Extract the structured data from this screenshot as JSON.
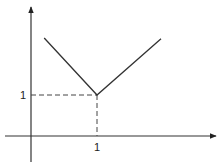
{
  "chart_data": {
    "type": "line",
    "title": "",
    "xlabel": "",
    "ylabel": "",
    "xlim": [
      -0.4,
      1.8
    ],
    "ylim": [
      -0.65,
      3.1
    ],
    "grid": false,
    "legend": "none",
    "series": [
      {
        "name": "V-shaped function",
        "x": [
          0.2,
          1,
          1.97
        ],
        "y": [
          2.39,
          1,
          2.37
        ]
      }
    ],
    "guides": [
      {
        "name": "horizontal-dashed-guide",
        "from": [
          0,
          1
        ],
        "to": [
          1,
          1
        ]
      },
      {
        "name": "vertical-dashed-guide",
        "from": [
          1,
          1
        ],
        "to": [
          1,
          0
        ]
      }
    ],
    "x_ticks": [
      {
        "value": 1,
        "label": "1"
      }
    ],
    "y_ticks": [
      {
        "value": 1,
        "label": "1"
      }
    ]
  }
}
